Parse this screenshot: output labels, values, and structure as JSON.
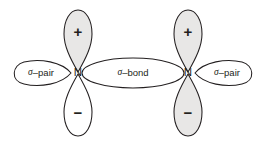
{
  "diagram": {
    "background_color": "#ffffff",
    "outline_color": "#231f20",
    "shaded_lobe_color": "#e8e7e6",
    "unshaded_lobe_color": "#ffffff",
    "atoms": [
      {
        "id": "left",
        "element_symbol": "N",
        "cx": 78,
        "cy": 73,
        "lobes": [
          {
            "id": "left-top",
            "orientation": "up",
            "sign": "+",
            "shaded": true
          },
          {
            "id": "left-bottom",
            "orientation": "down",
            "sign": "−",
            "shaded": false
          }
        ],
        "lone_pair": {
          "id": "left-sigma-pair",
          "label": "σ–pair",
          "sigma": "σ",
          "suffix": "–pair",
          "side": "left",
          "cx": 41,
          "cy": 73
        }
      },
      {
        "id": "right",
        "element_symbol": "N",
        "cx": 188,
        "cy": 73,
        "lobes": [
          {
            "id": "right-top",
            "orientation": "up",
            "sign": "+",
            "shaded": true
          },
          {
            "id": "right-bottom",
            "orientation": "down",
            "sign": "−",
            "shaded": true
          }
        ],
        "lone_pair": {
          "id": "right-sigma-pair",
          "label": "σ–pair",
          "sigma": "σ",
          "suffix": "–pair",
          "side": "right",
          "cx": 227,
          "cy": 73
        }
      }
    ],
    "bond": {
      "id": "sigma-bond",
      "label": "σ–bond",
      "sigma": "σ",
      "suffix": "–bond",
      "cx": 133,
      "cy": 73,
      "rx": 51,
      "ry": 15
    },
    "signs": {
      "positive": "+",
      "negative": "−"
    }
  }
}
